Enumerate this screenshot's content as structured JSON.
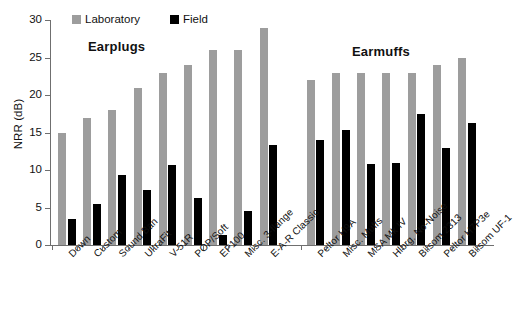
{
  "chart_data": {
    "type": "bar",
    "title": "",
    "xlabel": "",
    "ylabel": "NRR (dB)",
    "ylim": [
      0,
      30
    ],
    "ytick_labels": [
      "0",
      "5",
      "10",
      "15",
      "20",
      "25",
      "30"
    ],
    "ytick_values": [
      0,
      5,
      10,
      15,
      20,
      25,
      30
    ],
    "grid": false,
    "legend_position": "top-center",
    "legend": [
      "Laboratory",
      "Field"
    ],
    "group_labels": [
      "Earplugs",
      "Earmuffs"
    ],
    "categories": [
      "Down",
      "Custom",
      "Sound Ban",
      "UltraFit",
      "V-51R",
      "POP/Soft",
      "EP100",
      "Misc. 3-flange",
      "E-A-R Classic",
      "Peltor H9A",
      "Misc. Muffs",
      "MSA Mk IV",
      "Hlbrg. No-Noise",
      "Bilsom 2313",
      "Peltor H7P3e",
      "Bilsom UF-1"
    ],
    "groups": [
      {
        "name": "Earplugs",
        "categories": [
          "Down",
          "Custom",
          "Sound Ban",
          "UltraFit",
          "V-51R",
          "POP/Soft",
          "EP100",
          "Misc. 3-flange",
          "E-A-R Classic"
        ]
      },
      {
        "name": "Earmuffs",
        "categories": [
          "Peltor H9A",
          "Misc. Muffs",
          "MSA Mk IV",
          "Hlbrg. No-Noise",
          "Bilsom 2313",
          "Peltor H7P3e",
          "Bilsom UF-1"
        ]
      }
    ],
    "series": [
      {
        "name": "Laboratory",
        "color": "#9d9d9d",
        "values": [
          15,
          17,
          18,
          21,
          23,
          24,
          26,
          26,
          29,
          22,
          23,
          23,
          23,
          23,
          24,
          25
        ]
      },
      {
        "name": "Field",
        "color": "#000000",
        "values": [
          3.5,
          5.5,
          9.3,
          7.3,
          10.7,
          6.3,
          1.4,
          4.5,
          13.3,
          14.0,
          15.3,
          10.8,
          11.0,
          17.5,
          13.0,
          16.3
        ]
      }
    ]
  },
  "legend": {
    "laboratory_label": "Laboratory",
    "field_label": "Field"
  },
  "axes": {
    "y_title": "NRR (dB)"
  },
  "groups": {
    "earplugs_label": "Earplugs",
    "earmuffs_label": "Earmuffs"
  },
  "footer": {
    "caption": ""
  }
}
